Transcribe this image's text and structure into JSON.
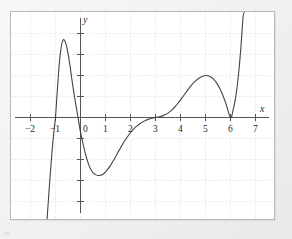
{
  "figure": {
    "background_color": "#f1f1f1",
    "plot_background_color": "#ffffff",
    "frame_color": "#b9b9b9",
    "grid_color": "#e4e4ec",
    "axis_color": "#555555",
    "curve_color": "#444444",
    "text_color": "#2a2a2a",
    "x_axis_label": "x",
    "y_axis_label": "y",
    "corner_mark": "ab"
  },
  "chart_data": {
    "type": "line",
    "title": "",
    "xlabel": "x",
    "ylabel": "y",
    "grid": true,
    "legend": "none",
    "xlim": [
      -2.6,
      7.6
    ],
    "ylim": [
      -5.2,
      5.0
    ],
    "xticks": [
      -2,
      -1,
      0,
      1,
      2,
      3,
      4,
      5,
      6,
      7
    ],
    "xtick_labels": [
      "−2",
      "−1",
      "0",
      "1",
      "2",
      "3",
      "4",
      "5",
      "6",
      "7"
    ],
    "yticks": [
      -5,
      -4,
      -3,
      -2,
      -1,
      1,
      2,
      3,
      4
    ],
    "ytick_labels": [
      "",
      "",
      "",
      "",
      "",
      "",
      "",
      "",
      ""
    ],
    "x_gridlines": [
      -2,
      -1,
      0,
      1,
      2,
      3,
      4,
      5,
      6,
      7
    ],
    "y_gridlines": [
      -4,
      -3,
      -2,
      -1,
      1,
      2,
      3,
      4
    ],
    "annotations": [],
    "series": [
      {
        "name": "polynomial",
        "roots": [
          -1.0,
          -0.1,
          3.0,
          6.0
        ],
        "root_multiplicities": [
          1,
          1,
          3,
          2
        ],
        "local_maxima": [
          {
            "x": -0.65,
            "y": 3.7
          },
          {
            "x": 5.0,
            "y": 2.0
          }
        ],
        "local_minima": [
          {
            "x": 0.8,
            "y": -2.75
          },
          {
            "x": 6.0,
            "y": 0.0
          }
        ],
        "x": [
          -1.35,
          -1.3,
          -1.25,
          -1.2,
          -1.15,
          -1.1,
          -1.05,
          -1.0,
          -0.95,
          -0.9,
          -0.85,
          -0.8,
          -0.75,
          -0.7,
          -0.65,
          -0.6,
          -0.55,
          -0.5,
          -0.45,
          -0.4,
          -0.35,
          -0.3,
          -0.25,
          -0.2,
          -0.15,
          -0.1,
          -0.05,
          0.0,
          0.1,
          0.2,
          0.3,
          0.4,
          0.5,
          0.6,
          0.7,
          0.8,
          0.9,
          1.0,
          1.1,
          1.2,
          1.3,
          1.4,
          1.5,
          1.6,
          1.7,
          1.8,
          1.9,
          2.0,
          2.1,
          2.2,
          2.3,
          2.4,
          2.5,
          2.6,
          2.7,
          2.8,
          2.9,
          3.0,
          3.1,
          3.2,
          3.3,
          3.4,
          3.5,
          3.6,
          3.7,
          3.8,
          3.9,
          4.0,
          4.2,
          4.4,
          4.6,
          4.8,
          5.0,
          5.2,
          5.4,
          5.6,
          5.8,
          6.0,
          6.1,
          6.2,
          6.3,
          6.4,
          6.5,
          6.55
        ],
        "y": [
          -5.1,
          -4.2,
          -3.35,
          -2.55,
          -1.8,
          -1.1,
          -0.5,
          0.0,
          0.9,
          1.75,
          2.55,
          3.1,
          3.5,
          3.68,
          3.7,
          3.58,
          3.35,
          3.05,
          2.7,
          2.3,
          1.85,
          1.45,
          1.05,
          0.7,
          0.35,
          0.0,
          -0.35,
          -0.7,
          -1.25,
          -1.75,
          -2.15,
          -2.45,
          -2.62,
          -2.72,
          -2.76,
          -2.75,
          -2.7,
          -2.6,
          -2.45,
          -2.28,
          -2.08,
          -1.88,
          -1.66,
          -1.45,
          -1.24,
          -1.05,
          -0.88,
          -0.72,
          -0.58,
          -0.46,
          -0.36,
          -0.27,
          -0.2,
          -0.14,
          -0.09,
          -0.05,
          -0.02,
          0.0,
          0.02,
          0.05,
          0.09,
          0.14,
          0.21,
          0.3,
          0.41,
          0.54,
          0.68,
          0.84,
          1.16,
          1.48,
          1.74,
          1.92,
          2.0,
          1.94,
          1.72,
          1.32,
          0.72,
          0.0,
          0.34,
          0.92,
          1.82,
          3.1,
          4.75,
          5.0
        ]
      }
    ]
  },
  "tick_labels": {
    "x": [
      {
        "text": "−2",
        "left": 14,
        "top": 114
      },
      {
        "text": "−1",
        "left": 38,
        "top": 114
      },
      {
        "text": "0",
        "left": 65,
        "top": 114
      },
      {
        "text": "1",
        "left": 89,
        "top": 114
      },
      {
        "text": "2",
        "left": 114,
        "top": 114
      },
      {
        "text": "3",
        "left": 139,
        "top": 114
      },
      {
        "text": "4",
        "left": 164,
        "top": 114
      },
      {
        "text": "5",
        "left": 189,
        "top": 114
      },
      {
        "text": "6",
        "left": 214,
        "top": 114
      },
      {
        "text": "7",
        "left": 239,
        "top": 114
      }
    ]
  }
}
